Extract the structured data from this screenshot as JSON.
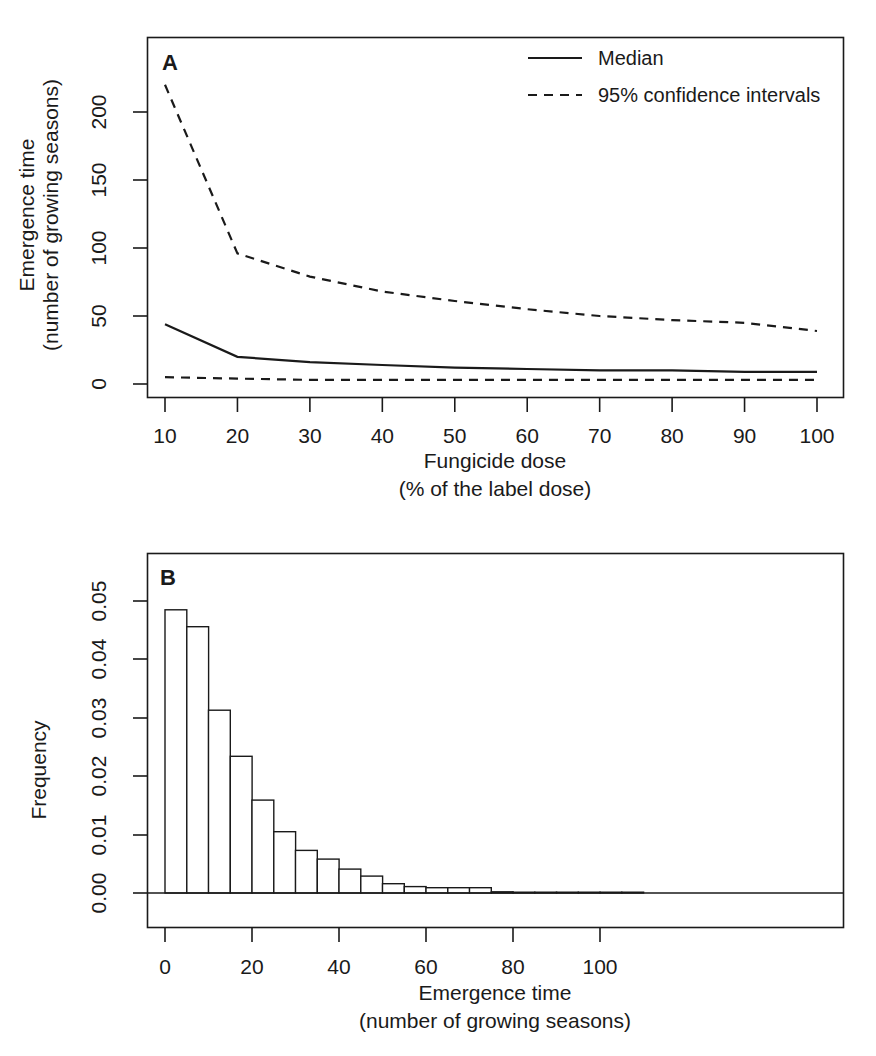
{
  "figure": {
    "panel_a_letter": "A",
    "panel_b_letter": "B"
  },
  "panel_a": {
    "legend": {
      "median_label": "Median",
      "ci_label": "95% confidence intervals"
    },
    "ylabel_line1": "Emergence time",
    "ylabel_line2": "(number of growing seasons)",
    "xlabel_line1": "Fungicide dose",
    "xlabel_line2": "(% of the label dose)",
    "ytick_labels": [
      "0",
      "50",
      "100",
      "150",
      "200"
    ],
    "xtick_labels": [
      "10",
      "20",
      "30",
      "40",
      "50",
      "60",
      "70",
      "80",
      "90",
      "100"
    ]
  },
  "panel_b": {
    "ylabel": "Frequency",
    "xlabel_line1": "Emergence time",
    "xlabel_line2": "(number of growing seasons)",
    "ytick_labels": [
      "0.00",
      "0.01",
      "0.02",
      "0.03",
      "0.04",
      "0.05"
    ],
    "xtick_labels": [
      "0",
      "20",
      "40",
      "60",
      "80",
      "100"
    ]
  },
  "chart_data": [
    {
      "type": "line",
      "title": "A",
      "xlabel": "Fungicide dose (% of the label dose)",
      "ylabel": "Emergence time (number of growing seasons)",
      "xlim": [
        8,
        102
      ],
      "ylim": [
        0,
        235
      ],
      "xticks": [
        10,
        20,
        30,
        40,
        50,
        60,
        70,
        80,
        90,
        100
      ],
      "yticks": [
        0,
        50,
        100,
        150,
        200
      ],
      "grid": false,
      "legend_position": "top-right",
      "x": [
        10,
        20,
        30,
        40,
        50,
        60,
        70,
        80,
        90,
        100
      ],
      "series": [
        {
          "name": "95% confidence intervals",
          "style": "dashed",
          "role": "upper",
          "values": [
            220,
            96,
            79,
            68,
            61,
            55,
            50,
            47,
            45,
            39
          ]
        },
        {
          "name": "Median",
          "style": "solid",
          "role": "median",
          "values": [
            44,
            20,
            16,
            14,
            12,
            11,
            10,
            10,
            9,
            9
          ]
        },
        {
          "name": "95% confidence intervals",
          "style": "dashed",
          "role": "lower",
          "values": [
            5,
            4,
            3,
            3,
            3,
            3,
            3,
            3,
            3,
            3
          ]
        }
      ]
    },
    {
      "type": "bar",
      "title": "B",
      "xlabel": "Emergence time (number of growing seasons)",
      "ylabel": "Frequency",
      "xlim": [
        0,
        112
      ],
      "ylim": [
        0,
        0.052
      ],
      "xticks": [
        0,
        20,
        40,
        60,
        80,
        100
      ],
      "yticks": [
        0.0,
        0.01,
        0.02,
        0.03,
        0.04,
        0.05
      ],
      "grid": false,
      "bin_width": 5,
      "bin_starts": [
        0,
        5,
        10,
        15,
        20,
        25,
        30,
        35,
        40,
        45,
        50,
        55,
        60,
        65,
        70,
        75,
        80,
        85,
        90,
        95,
        100,
        105
      ],
      "values": [
        0.0485,
        0.0456,
        0.0313,
        0.0234,
        0.0159,
        0.0105,
        0.0073,
        0.0058,
        0.0041,
        0.0029,
        0.0016,
        0.0011,
        0.0009,
        0.0009,
        0.0009,
        0.0002,
        0.0001,
        0.0001,
        0.0,
        0.0,
        0.0,
        0.0
      ]
    }
  ]
}
